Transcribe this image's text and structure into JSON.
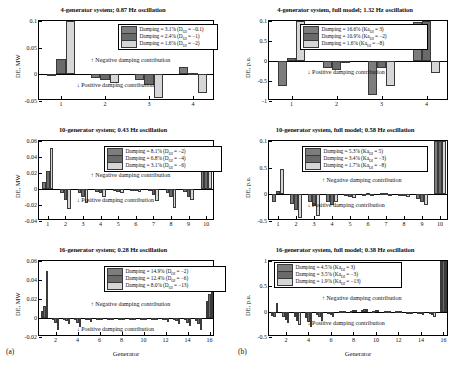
{
  "figure": {
    "subfigure_labels": [
      {
        "name": "a",
        "text": "(a)"
      },
      {
        "name": "b",
        "text": "(b)"
      }
    ],
    "colors": {
      "series1": "#7d7d7d",
      "series2": "#6a6a6a",
      "series3": "#d6d6d6",
      "axis": "#000000"
    },
    "annotations": {
      "negative": "↑ Negative damping contribution",
      "positive": "↓ Positive damping contribution"
    },
    "xlabel": "Generator"
  },
  "chart_data": [
    {
      "id": "panel-top-left",
      "type": "bar",
      "title": "4-generator system; 0.87 Hz oscillation",
      "xlabel": "",
      "ylabel": "DE, MW",
      "ylim": [
        -0.05,
        0.1
      ],
      "yticks": [
        -0.05,
        0,
        0.05,
        0.1
      ],
      "ytick_labels": [
        "-0.05",
        "0",
        "0.05",
        "0.1"
      ],
      "categories": [
        1,
        2,
        3,
        4
      ],
      "xtick_labels": [
        "1",
        "2",
        "3",
        "4"
      ],
      "grid": false,
      "legend_position": "top-right",
      "series": [
        {
          "name": "Damping = 3.1% (D_OI = -0.1)",
          "label_main": "Damping = 3.1% (D",
          "label_sub": "OI",
          "label_tail": " = −0.1)",
          "values": [
            0.0015,
            -0.006,
            -0.011,
            0.014
          ]
        },
        {
          "name": "Damping = 2.4% (D_OI = -1)",
          "label_main": "Damping = 2.4% (D",
          "label_sub": "OI",
          "label_tail": " = −1)",
          "values": [
            0.0295,
            -0.0105,
            -0.0195,
            0.002
          ]
        },
        {
          "name": "Damping = 1.6% (D_OI = -2)",
          "label_main": "Damping = 1.6% (D",
          "label_sub": "OI",
          "label_tail": " = −2)",
          "values": [
            0.1,
            -0.0165,
            -0.0435,
            -0.0355
          ]
        }
      ]
    },
    {
      "id": "panel-top-right",
      "type": "bar",
      "title": "4-generator system, full model; 1.32 Hz oscillation",
      "xlabel": "",
      "ylabel": "DE, p.u.",
      "ylim": [
        -1,
        1
      ],
      "yticks": [
        -1,
        -0.5,
        0,
        0.5,
        1
      ],
      "ytick_labels": [
        "-1",
        "-0.5",
        "0",
        "0.5",
        "0.1"
      ],
      "categories": [
        1,
        2,
        3,
        4
      ],
      "xtick_labels": [
        "1",
        "2",
        "3",
        "4"
      ],
      "grid": false,
      "legend_position": "top-center",
      "series": [
        {
          "name": "Damping = 16.6% (Ka_OI = 3)",
          "label_main": "Damping = 16.6% (Ka",
          "label_sub": "OI",
          "label_tail": " = 3)",
          "values": [
            -0.63,
            -0.17,
            -0.86,
            0.98
          ]
        },
        {
          "name": "Damping = 10.9% (Ka_OI = -2)",
          "label_main": "Damping = 10.9% (Ka",
          "label_sub": "OI",
          "label_tail": " = −2)",
          "values": [
            0.07,
            -0.22,
            -0.17,
            1.0
          ]
        },
        {
          "name": "Damping = 1.6% (Ka_OI = -8)",
          "label_main": "Damping = 1.6% (Ka",
          "label_sub": "OI",
          "label_tail": " = −8)",
          "values": [
            1.0,
            -0.055,
            -0.63,
            -0.29
          ]
        }
      ]
    },
    {
      "id": "panel-mid-left",
      "type": "bar",
      "title": "10-generator system; 0.43 Hz oscillation",
      "xlabel": "",
      "ylabel": "DE, MW",
      "ylim": [
        -0.04,
        0.06
      ],
      "yticks": [
        -0.04,
        -0.02,
        0,
        0.02,
        0.04,
        0.06
      ],
      "ytick_labels": [
        "-0.04",
        "-0.02",
        "0",
        "0.02",
        "0.04",
        "0.06"
      ],
      "categories": [
        1,
        2,
        3,
        4,
        5,
        6,
        7,
        8,
        9,
        10
      ],
      "xtick_labels": [
        "1",
        "2",
        "3",
        "4",
        "5",
        "6",
        "7",
        "8",
        "9",
        "10"
      ],
      "grid": false,
      "legend_position": "top-center",
      "series": [
        {
          "name": "Damping = 8.1% (D_OI = -2)",
          "label_main": "Damping = 8.1% (D",
          "label_sub": "OI",
          "label_tail": " = −2)",
          "values": [
            0.0085,
            -0.0045,
            -0.0055,
            -0.0035,
            -0.0022,
            -0.0012,
            -0.0028,
            -0.0045,
            -0.0035,
            0.0385
          ]
        },
        {
          "name": "Damping = 6.8% (D_OI = -4)",
          "label_main": "Damping = 6.8% (D",
          "label_sub": "OI",
          "label_tail": " = −4)",
          "values": [
            0.0225,
            -0.0135,
            -0.0105,
            -0.0055,
            -0.0032,
            -0.0022,
            -0.0075,
            -0.0105,
            -0.0095,
            0.0395
          ]
        },
        {
          "name": "Damping = 3.1% (D_OI = -6)",
          "label_main": "Damping = 3.1% (D",
          "label_sub": "OI",
          "label_tail": " = −6)",
          "values": [
            0.0515,
            -0.0255,
            -0.0175,
            -0.0095,
            -0.0048,
            -0.0042,
            -0.0155,
            -0.0235,
            -0.0135,
            0.0415
          ]
        }
      ]
    },
    {
      "id": "panel-mid-right",
      "type": "bar",
      "title": "10-generator system, full model; 0.58 Hz oscillation",
      "xlabel": "",
      "ylabel": "DE, p.u.",
      "ylim": [
        -0.5,
        1
      ],
      "yticks": [
        -0.5,
        0,
        0.5,
        1
      ],
      "ytick_labels": [
        "-0.5",
        "0",
        "0.5",
        "0.1"
      ],
      "categories": [
        1,
        2,
        3,
        4,
        5,
        6,
        7,
        8,
        9,
        10
      ],
      "xtick_labels": [
        "1",
        "2",
        "3",
        "4",
        "5",
        "6",
        "7",
        "8",
        "9",
        "10"
      ],
      "grid": false,
      "legend_position": "top-center",
      "series": [
        {
          "name": "Damping = 5.3% (Ka_OI = 5)",
          "label_main": "Damping = 5.3% (Ka",
          "label_sub": "OI",
          "label_tail": " = 5)",
          "values": [
            -0.135,
            -0.175,
            -0.145,
            -0.135,
            -0.035,
            0.012,
            0.022,
            -0.022,
            -0.095,
            1.0
          ]
        },
        {
          "name": "Damping = 3.4% (Ka_OI = -3)",
          "label_main": "Damping = 3.4% (Ka",
          "label_sub": "OI",
          "label_tail": " = −3)",
          "values": [
            0.065,
            -0.295,
            -0.225,
            -0.205,
            -0.055,
            0.018,
            0.032,
            -0.035,
            -0.145,
            1.0
          ]
        },
        {
          "name": "Damping = 1.7% (Ka_OI = -8)",
          "label_main": "Damping = 1.7% (Ka",
          "label_sub": "OI",
          "label_tail": " = −8)",
          "values": [
            0.48,
            -0.435,
            -0.415,
            -0.135,
            -0.075,
            0.008,
            0.012,
            -0.045,
            -0.195,
            1.0
          ]
        }
      ]
    },
    {
      "id": "panel-bot-left",
      "type": "bar",
      "title": "16-generator system; 0.28 Hz oscillation",
      "xlabel": "Generator",
      "ylabel": "DE, MW",
      "ylim": [
        -0.02,
        0.06
      ],
      "yticks": [
        -0.02,
        0,
        0.02,
        0.04,
        0.06
      ],
      "ytick_labels": [
        "-0.02",
        "0",
        "0.02",
        "0.04",
        "0.06"
      ],
      "categories": [
        1,
        2,
        3,
        4,
        5,
        6,
        7,
        8,
        9,
        10,
        11,
        12,
        13,
        14,
        15,
        16
      ],
      "xtick_labels": [
        "2",
        "4",
        "6",
        "8",
        "10",
        "12",
        "14",
        "16"
      ],
      "grid": false,
      "legend_position": "top-center",
      "series": [
        {
          "name": "Damping = 14.9% (D_OI = -2)",
          "label_main": "Damping = 14.9% (D",
          "label_sub": "OI",
          "label_tail": " = −2)",
          "values": [
            0.0075,
            -0.0022,
            -0.0018,
            -0.0022,
            -0.0012,
            -0.0008,
            -0.0008,
            -0.0008,
            -0.0008,
            -0.0008,
            -0.0008,
            -0.0012,
            -0.0018,
            -0.0022,
            -0.0028,
            0.0175
          ]
        },
        {
          "name": "Damping = 12.4% (D_OI = -6)",
          "label_main": "Damping = 12.4% (D",
          "label_sub": "OI",
          "label_tail": " = −6)",
          "values": [
            0.0125,
            -0.0048,
            -0.0032,
            -0.0048,
            -0.0022,
            -0.0014,
            -0.0014,
            -0.0014,
            -0.0014,
            -0.0014,
            -0.0014,
            -0.0022,
            -0.0032,
            -0.0048,
            -0.0062,
            0.0255
          ]
        },
        {
          "name": "Damping = 8.0% (D_OI = -13)",
          "label_main": "Damping = 8.0% (D",
          "label_sub": "OI",
          "label_tail": " = −13)",
          "values": [
            0.0495,
            -0.0125,
            -0.0062,
            -0.0092,
            -0.0042,
            -0.0022,
            -0.0022,
            -0.0022,
            -0.0022,
            -0.0022,
            -0.0022,
            -0.0038,
            -0.0058,
            -0.0085,
            -0.0125,
            0.0335
          ]
        }
      ]
    },
    {
      "id": "panel-bot-right",
      "type": "bar",
      "title": "16-generator system, full model; 0.38 Hz oscillation",
      "xlabel": "Generator",
      "ylabel": "DE, p.u.",
      "ylim": [
        -0.5,
        1
      ],
      "yticks": [
        -0.5,
        0,
        0.5,
        1
      ],
      "ytick_labels": [
        "-0.5",
        "0",
        "0.5",
        "1"
      ],
      "categories": [
        1,
        2,
        3,
        4,
        5,
        6,
        7,
        8,
        9,
        10,
        11,
        12,
        13,
        14,
        15,
        16
      ],
      "xtick_labels": [
        "2",
        "4",
        "6",
        "8",
        "10",
        "12",
        "14",
        "16"
      ],
      "grid": false,
      "legend_position": "top-left",
      "series": [
        {
          "name": "Damping = 4.5% (Ka_OI = 3)",
          "label_main": "Damping = 4.5% (Ka",
          "label_sub": "OI",
          "label_tail": " = 3)",
          "values": [
            -0.085,
            -0.105,
            -0.115,
            -0.135,
            -0.075,
            -0.045,
            0.012,
            0.022,
            0.032,
            0.018,
            0.012,
            0.008,
            -0.018,
            -0.035,
            -0.055,
            1.0
          ]
        },
        {
          "name": "Damping = 3.5% (Ka_OI = -3)",
          "label_main": "Damping = 3.5% (Ka",
          "label_sub": "OI",
          "label_tail": " = −3)",
          "values": [
            -0.105,
            -0.165,
            -0.175,
            -0.195,
            -0.115,
            -0.065,
            0.018,
            0.032,
            0.045,
            0.025,
            0.016,
            0.01,
            -0.025,
            -0.055,
            -0.075,
            1.0
          ]
        },
        {
          "name": "Damping = 1.9% (Ka_OI = -13)",
          "label_main": "Damping = 1.9% (Ka",
          "label_sub": "OI",
          "label_tail": " = −13)",
          "values": [
            0.175,
            -0.215,
            -0.255,
            -0.295,
            -0.185,
            -0.105,
            0.022,
            0.042,
            0.058,
            0.032,
            0.02,
            0.012,
            -0.032,
            -0.075,
            -0.115,
            1.0
          ]
        }
      ]
    }
  ]
}
